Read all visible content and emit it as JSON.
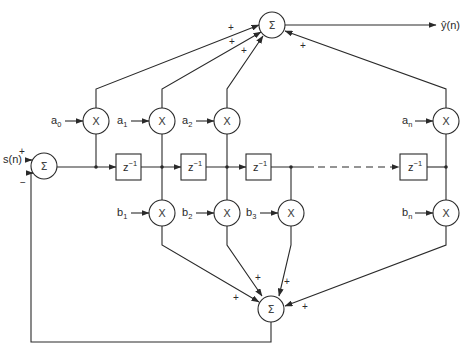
{
  "diagram": {
    "title": "",
    "input_label": "s(n)",
    "output_label": "ŷ(n)",
    "summer_symbol": "Σ",
    "multiplier_symbol": "X",
    "delay": {
      "base": "z",
      "exp": "−1"
    },
    "input_summer_signs": {
      "input": "+",
      "feedback": "−"
    },
    "a_coeffs": [
      {
        "base": "a",
        "sub": "0"
      },
      {
        "base": "a",
        "sub": "1"
      },
      {
        "base": "a",
        "sub": "2"
      },
      {
        "base": "a",
        "sub": "n"
      }
    ],
    "b_coeffs": [
      {
        "base": "b",
        "sub": "1"
      },
      {
        "base": "b",
        "sub": "2"
      },
      {
        "base": "b",
        "sub": "3"
      },
      {
        "base": "b",
        "sub": "n"
      }
    ],
    "top_summer_signs": [
      "+",
      "+",
      "+",
      "+"
    ],
    "bottom_summer_signs": [
      "+",
      "+",
      "+",
      "+"
    ],
    "colors": {
      "ink": "#2a2a2a",
      "background": "#ffffff"
    }
  }
}
